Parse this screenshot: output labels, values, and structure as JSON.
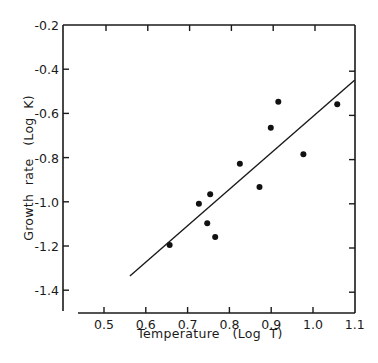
{
  "chart_data": {
    "type": "scatter",
    "title": "",
    "xlabel": "Temperature   (Log  T)",
    "ylabel": "Growth  rate   (Log  K)",
    "xlim": [
      0.4,
      1.1
    ],
    "ylim": [
      -1.5,
      -0.2
    ],
    "x_ticks": [
      0.5,
      0.6,
      0.7,
      0.8,
      0.9,
      1.0,
      1.1
    ],
    "x_tick_labels": [
      "0.5",
      "0.6",
      "0.7",
      "0.8",
      "0.9",
      "1.0",
      "1.1"
    ],
    "y_ticks": [
      -0.2,
      -0.4,
      -0.6,
      -0.8,
      -1.0,
      -1.2,
      -1.4
    ],
    "y_tick_labels": [
      "-0.2",
      "-0.4",
      "-0.6",
      "-0.8",
      "-1.0",
      "-1.2",
      "-1.4"
    ],
    "grid": false,
    "legend": null,
    "series": [
      {
        "name": "observations",
        "kind": "points",
        "x": [
          0.657,
          0.727,
          0.747,
          0.754,
          0.766,
          0.825,
          0.872,
          0.899,
          0.917,
          0.977,
          1.058
        ],
        "y": [
          -1.195,
          -1.009,
          -1.097,
          -0.966,
          -1.159,
          -0.828,
          -0.933,
          -0.665,
          -0.547,
          -0.785,
          -0.559
        ]
      },
      {
        "name": "regression line",
        "kind": "line",
        "x": [
          0.562,
          1.1
        ],
        "y": [
          -1.336,
          -0.449
        ]
      }
    ]
  },
  "axes": {
    "x_title": "Temperature   (Log  T)",
    "y_title": "Growth  rate   (Log  K)"
  },
  "colors": {
    "ink": "#1a1a1a",
    "background": "#ffffff"
  }
}
